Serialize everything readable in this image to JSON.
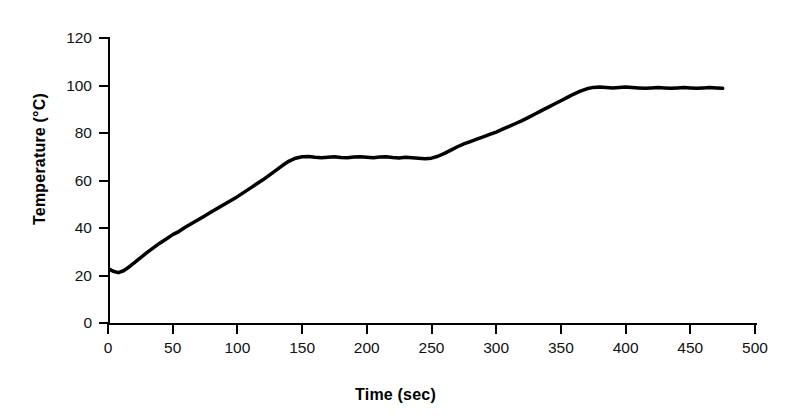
{
  "chart_data": {
    "type": "line",
    "title": "",
    "xlabel": "Time (sec)",
    "ylabel": "Temperature (°C)",
    "xlim": [
      0,
      500
    ],
    "ylim": [
      0,
      120
    ],
    "xticks": [
      0,
      50,
      100,
      150,
      200,
      250,
      300,
      350,
      400,
      450,
      500
    ],
    "yticks": [
      0,
      20,
      40,
      60,
      80,
      100,
      120
    ],
    "grid": false,
    "legend": null,
    "line_color": "#000000",
    "line_width": 3.5,
    "series": [
      {
        "name": "Temperature",
        "x": [
          0,
          4,
          8,
          12,
          16,
          20,
          25,
          30,
          35,
          40,
          45,
          50,
          55,
          60,
          65,
          70,
          75,
          80,
          85,
          90,
          95,
          100,
          105,
          110,
          115,
          120,
          125,
          130,
          135,
          140,
          145,
          150,
          155,
          160,
          165,
          170,
          175,
          180,
          185,
          190,
          195,
          200,
          205,
          210,
          215,
          220,
          225,
          230,
          235,
          240,
          245,
          250,
          255,
          260,
          265,
          270,
          275,
          280,
          285,
          290,
          295,
          300,
          305,
          310,
          315,
          320,
          325,
          330,
          335,
          340,
          345,
          350,
          355,
          360,
          365,
          370,
          375,
          380,
          385,
          390,
          395,
          400,
          405,
          410,
          415,
          420,
          425,
          430,
          435,
          440,
          445,
          450,
          455,
          460,
          465,
          470,
          475
        ],
        "y": [
          23.0,
          21.8,
          21.2,
          22.0,
          23.5,
          25.2,
          27.4,
          29.6,
          31.6,
          33.6,
          35.4,
          37.2,
          38.6,
          40.4,
          42.0,
          43.6,
          45.2,
          46.8,
          48.4,
          50.0,
          51.6,
          53.2,
          55.0,
          56.8,
          58.6,
          60.4,
          62.4,
          64.4,
          66.4,
          68.2,
          69.4,
          70.0,
          70.1,
          69.8,
          69.6,
          69.8,
          70.0,
          69.7,
          69.6,
          69.9,
          70.0,
          69.8,
          69.6,
          69.9,
          70.0,
          69.7,
          69.5,
          69.8,
          69.6,
          69.4,
          69.2,
          69.4,
          70.2,
          71.4,
          72.8,
          74.2,
          75.4,
          76.4,
          77.4,
          78.4,
          79.4,
          80.4,
          81.6,
          82.8,
          84.0,
          85.2,
          86.6,
          88.0,
          89.4,
          90.8,
          92.2,
          93.6,
          95.0,
          96.4,
          97.6,
          98.6,
          99.2,
          99.4,
          99.2,
          99.0,
          99.2,
          99.4,
          99.2,
          99.0,
          98.8,
          99.0,
          99.2,
          99.0,
          98.8,
          99.0,
          99.2,
          99.0,
          98.8,
          99.0,
          99.2,
          99.0,
          98.8
        ]
      }
    ],
    "annotations": [
      {
        "label": "initial dip",
        "x": 8,
        "y": 21.2
      },
      {
        "label": "first plateau",
        "x": 190,
        "y": 70.0
      },
      {
        "label": "boiling plateau",
        "x": 430,
        "y": 99.0
      }
    ]
  }
}
